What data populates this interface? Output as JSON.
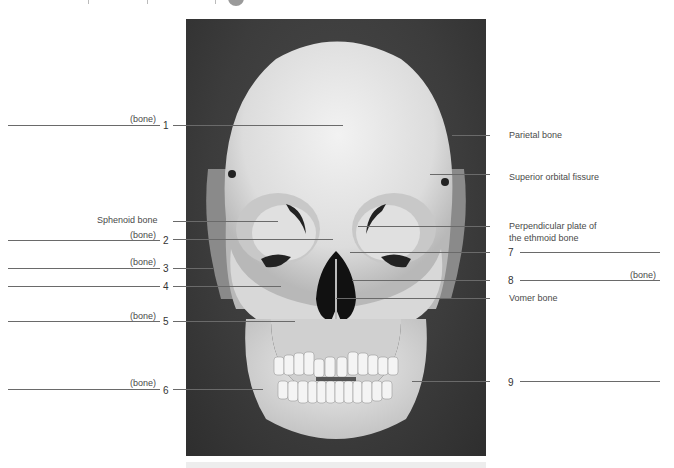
{
  "figure": {
    "placeholder_word": "(bone)"
  },
  "left_labels": [
    {
      "number": "1",
      "text": "(bone)"
    },
    {
      "text": "Sphenoid bone"
    },
    {
      "number": "2",
      "text": "(bone)"
    },
    {
      "number": "3",
      "text": "(bone)"
    },
    {
      "number": "4",
      "text": ""
    },
    {
      "number": "5",
      "text": "(bone)"
    },
    {
      "number": "6",
      "text": "(bone)"
    }
  ],
  "right_labels": [
    {
      "text": "Parietal bone"
    },
    {
      "text": "Superior orbital fissure"
    },
    {
      "text_line1": "Perpendicular plate of",
      "text_line2": "the ethmoid bone"
    },
    {
      "number": "7",
      "text": ""
    },
    {
      "number": "8",
      "text": "(bone)"
    },
    {
      "text": "Vomer bone"
    },
    {
      "number": "9",
      "text": ""
    }
  ],
  "colors": {
    "photo_bg": "#3c3c3c",
    "bone": "#e6e6e6",
    "leader_line": "#6a6a6a"
  }
}
